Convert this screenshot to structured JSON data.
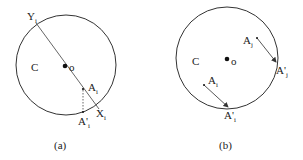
{
  "panels": [
    {
      "caption": "(a)",
      "circle_label": "C",
      "center_label": "o",
      "points": {
        "Y": "Y",
        "Y_sub": "i",
        "X": "X",
        "X_sub": "i",
        "A": "A",
        "A_sub": "i",
        "A_prime": "A'",
        "A_prime_sub": "i"
      }
    },
    {
      "caption": "(b)",
      "circle_label": "C",
      "center_label": "o",
      "points": {
        "Aj": "A",
        "Aj_sub": "j",
        "Aj_prime": "A'",
        "Aj_prime_sub": "j",
        "Ai": "A",
        "Ai_sub": "i",
        "Ai_prime": "A'",
        "Ai_prime_sub": "i"
      }
    }
  ],
  "colors": {
    "stroke": "#333333",
    "background": "#ffffff"
  }
}
